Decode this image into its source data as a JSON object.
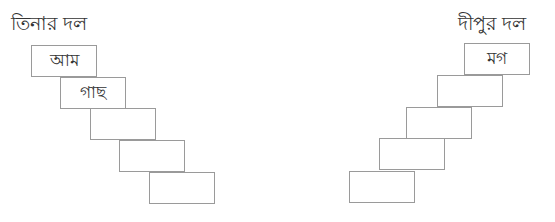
{
  "left_team": {
    "title": "তিনার দল",
    "boxes": [
      {
        "value": "আম"
      },
      {
        "value": "গাছ"
      },
      {
        "value": ""
      },
      {
        "value": ""
      },
      {
        "value": ""
      }
    ]
  },
  "right_team": {
    "title": "দীপুর দল",
    "boxes": [
      {
        "value": "মগ"
      },
      {
        "value": ""
      },
      {
        "value": ""
      },
      {
        "value": ""
      },
      {
        "value": ""
      }
    ]
  }
}
